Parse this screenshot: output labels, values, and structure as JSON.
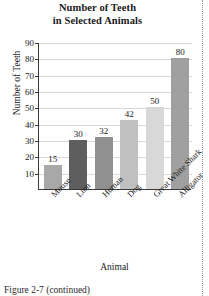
{
  "chart_data": {
    "type": "bar",
    "title": "Number of Teeth in Selected Animals",
    "title_lines": [
      "Number of Teeth",
      "in Selected Animals"
    ],
    "xlabel": "Animal",
    "ylabel": "Number of Teeth",
    "categories": [
      "Mouse",
      "Lion",
      "Human",
      "Dog",
      "Great White Shark",
      "Alligator"
    ],
    "values": [
      15,
      30,
      32,
      42,
      50,
      80
    ],
    "value_labels": [
      "15",
      "30",
      "32",
      "42",
      "50",
      "80"
    ],
    "bar_colors": [
      "#a8a8a8",
      "#5e5e5e",
      "#909090",
      "#c0c0c0",
      "#d8d8d8",
      "#a0a0a0"
    ],
    "ylim": [
      0,
      90
    ],
    "yticks": [
      10,
      20,
      30,
      40,
      50,
      60,
      70,
      80,
      90
    ],
    "ytick_labels": [
      "10",
      "20",
      "30",
      "40",
      "50",
      "60",
      "70",
      "80",
      "90"
    ],
    "grid": true,
    "grid_axis": "y",
    "legend": null,
    "legend_position": "none"
  },
  "caption": {
    "text": "Figure 2-7 (continued)"
  },
  "axis_colors": {
    "axis_line": "#3a3a3a",
    "gridline": "#d8d8d8",
    "page_rule": "#9a9a9a"
  }
}
